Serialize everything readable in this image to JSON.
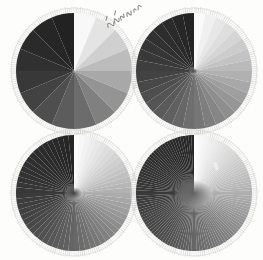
{
  "figure": {
    "background_color": "#fdfdfc",
    "width": 263,
    "height": 260,
    "annotation": {
      "text": "",
      "description": "handwritten-annotation",
      "rotation_deg": -32,
      "x": 96,
      "y": 2,
      "color": "#8a8a88"
    }
  },
  "chart_data": {
    "type": "pie",
    "subtitle": "Four radial sector targets with doubling sector counts",
    "xlabel": "",
    "ylabel": "",
    "legend": "none",
    "grid": false,
    "layout": "2x2",
    "shared": {
      "sweep": "clockwise from 12 o'clock",
      "gradient": "white to black, one full ramp per revolution",
      "equal_slices": true,
      "ring": {
        "name": "radial-tick-ring",
        "tick_count": 180,
        "color": "#b9b9b7",
        "inner_ratio": 0.92,
        "outer_ratio": 1.0
      }
    },
    "panels": [
      {
        "id": "disc-top-left",
        "position": "top-left",
        "sectors": 16,
        "center_x": 74,
        "center_y": 71,
        "radius": 58,
        "center_blob": {
          "present": false,
          "radius": 0,
          "gray": 0
        },
        "gray_values": [
          248,
          228,
          208,
          188,
          168,
          148,
          128,
          108,
          92,
          78,
          66,
          56,
          48,
          42,
          38,
          34
        ],
        "defects": []
      },
      {
        "id": "disc-top-right",
        "position": "top-right",
        "sectors": 32,
        "center_x": 194,
        "center_y": 71,
        "radius": 58,
        "center_blob": {
          "present": true,
          "radius": 3,
          "gray": 70
        },
        "gray_values": [
          250,
          240,
          231,
          222,
          213,
          204,
          195,
          186,
          177,
          168,
          159,
          150,
          142,
          134,
          126,
          118,
          110,
          103,
          96,
          90,
          84,
          78,
          72,
          67,
          62,
          57,
          53,
          49,
          45,
          42,
          39,
          36
        ],
        "defects": []
      },
      {
        "id": "disc-bottom-left",
        "position": "bottom-left",
        "sectors": 64,
        "center_x": 74,
        "center_y": 193,
        "radius": 58,
        "center_blob": {
          "present": true,
          "radius": 6,
          "gray": 60
        },
        "gray_values": [
          252,
          247,
          242,
          237,
          232,
          227,
          222,
          217,
          212,
          207,
          202,
          197,
          192,
          187,
          182,
          177,
          172,
          167,
          162,
          157,
          152,
          147,
          142,
          137,
          132,
          128,
          124,
          120,
          116,
          112,
          108,
          104,
          100,
          96,
          93,
          90,
          87,
          84,
          81,
          78,
          75,
          72,
          69,
          66,
          64,
          62,
          60,
          58,
          56,
          54,
          52,
          50,
          48,
          47,
          46,
          45,
          44,
          43,
          42,
          41,
          40,
          39,
          38,
          37
        ],
        "defects": []
      },
      {
        "id": "disc-bottom-right",
        "position": "bottom-right",
        "sectors": 128,
        "center_x": 194,
        "center_y": 193,
        "radius": 58,
        "center_blob": {
          "present": true,
          "radius": 13,
          "gray": 96
        },
        "gray_values": [
          253,
          251,
          248,
          246,
          243,
          241,
          238,
          236,
          233,
          231,
          228,
          226,
          223,
          221,
          218,
          216,
          213,
          211,
          208,
          206,
          203,
          201,
          198,
          196,
          193,
          191,
          188,
          186,
          183,
          181,
          178,
          176,
          173,
          171,
          168,
          166,
          163,
          161,
          158,
          156,
          153,
          151,
          148,
          146,
          143,
          141,
          138,
          136,
          133,
          131,
          129,
          127,
          125,
          123,
          121,
          119,
          117,
          115,
          113,
          111,
          109,
          107,
          105,
          103,
          101,
          99,
          97,
          95,
          93,
          91,
          89,
          87,
          85,
          83,
          81,
          79,
          77,
          76,
          75,
          74,
          73,
          72,
          71,
          70,
          69,
          68,
          67,
          66,
          65,
          64,
          63,
          62,
          61,
          60,
          59,
          58,
          57,
          56,
          55,
          54,
          53,
          52,
          51,
          50,
          49,
          49,
          48,
          48,
          47,
          47,
          46,
          46,
          45,
          45,
          44,
          44,
          43,
          43,
          42,
          42,
          41,
          41,
          40,
          40,
          39,
          39,
          38,
          38
        ],
        "defects": [
          {
            "name": "bright-scratch",
            "x": 216,
            "y": 166,
            "w": 4,
            "h": 9,
            "gray": 240
          }
        ]
      }
    ]
  }
}
